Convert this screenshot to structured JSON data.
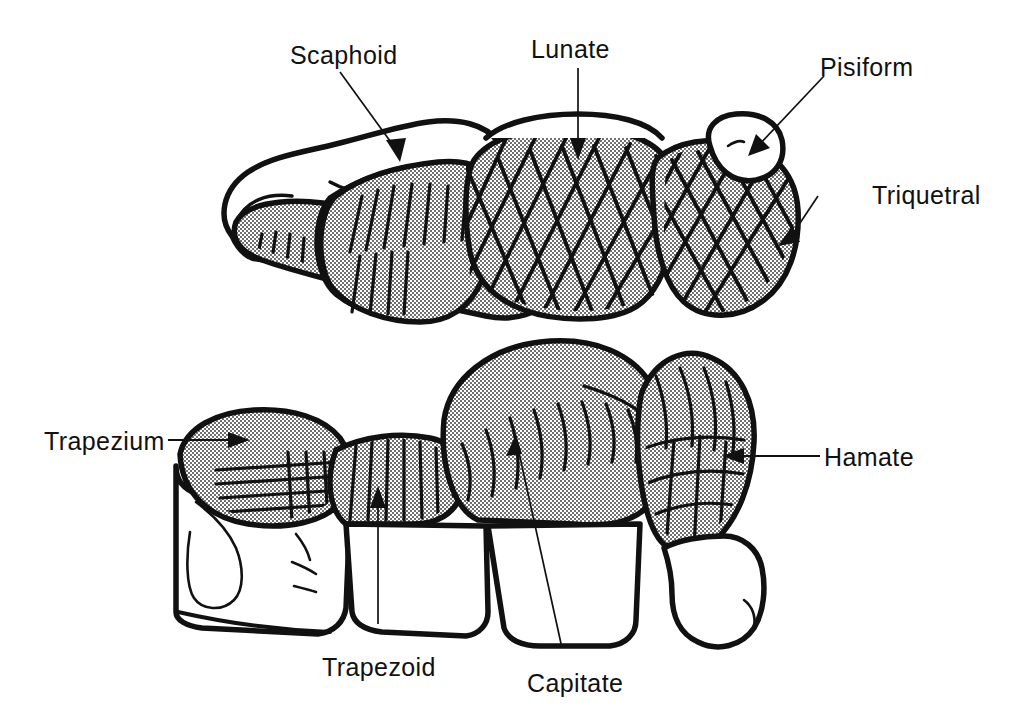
{
  "figure": {
    "background_color": "#ffffff",
    "ink_color": "#111111",
    "shading_color": "#b9b9b9",
    "rows": [
      {
        "name": "proximal-row",
        "bones": [
          "Scaphoid",
          "Lunate",
          "Triquetral",
          "Pisiform"
        ]
      },
      {
        "name": "distal-row",
        "bones": [
          "Trapezium",
          "Trapezoid",
          "Capitate",
          "Hamate"
        ]
      }
    ]
  },
  "labels": {
    "scaphoid": "Scaphoid",
    "lunate": "Lunate",
    "pisiform": "Pisiform",
    "triquetral": "Triquetral",
    "trapezium": "Trapezium",
    "trapezoid": "Trapezoid",
    "capitate": "Capitate",
    "hamate": "Hamate"
  }
}
